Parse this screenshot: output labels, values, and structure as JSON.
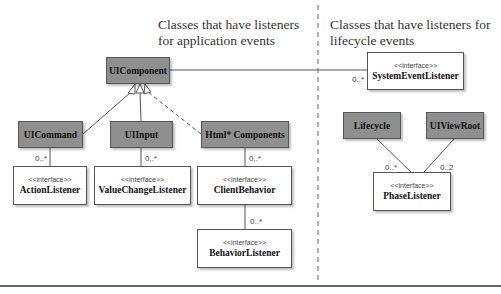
{
  "headers": {
    "left": [
      "Classes that have listeners",
      "for application events"
    ],
    "right": [
      "Classes that have listeners for",
      "lifecycle events"
    ]
  },
  "classes": {
    "ui_component": "UIComponent",
    "ui_command": "UICommand",
    "ui_input": "UIInput",
    "html_components": "Html* Components",
    "lifecycle": "Lifecycle",
    "ui_view_root": "UIViewRoot"
  },
  "interfaces": {
    "stereotype": "<<interface>>",
    "system_event_listener": "SystemEventListener",
    "action_listener": "ActionListener",
    "value_change_listener": "ValueChangeListener",
    "client_behavior": "ClientBehavior",
    "behavior_listener": "BehaviorListener",
    "phase_listener": "PhaseListener"
  },
  "multiplicities": {
    "system_event": "0..*",
    "action": "0..*",
    "value_change": "0..*",
    "client_behavior": "0..*",
    "behavior_listener": "0..*",
    "phase_lifecycle": "0..*",
    "phase_viewroot": "0..2"
  },
  "colors": {
    "class_fill": "#8f8f8f",
    "interface_fill": "#ffffff",
    "line": "#555555"
  }
}
